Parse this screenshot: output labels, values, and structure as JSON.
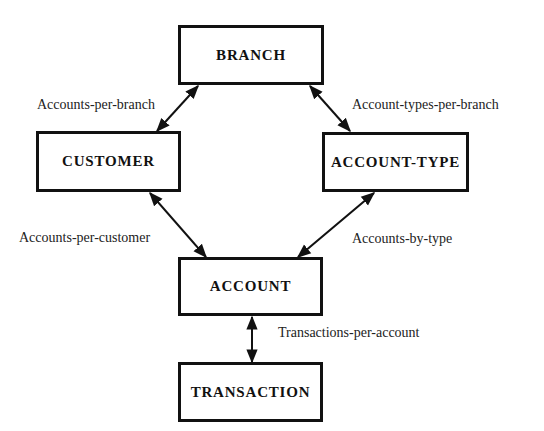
{
  "entities": {
    "branch": "BRANCH",
    "customer": "CUSTOMER",
    "account_type": "ACCOUNT-TYPE",
    "account": "ACCOUNT",
    "transaction": "TRANSACTION"
  },
  "relationships": {
    "accounts_per_branch": "Accounts-per-branch",
    "account_types_per_branch": "Account-types-per-branch",
    "accounts_per_customer": "Accounts-per-customer",
    "accounts_by_type": "Accounts-by-type",
    "transactions_per_account": "Transactions-per-account"
  },
  "links": [
    {
      "from": "branch",
      "to": "customer",
      "label": "accounts_per_branch"
    },
    {
      "from": "branch",
      "to": "account_type",
      "label": "account_types_per_branch"
    },
    {
      "from": "customer",
      "to": "account",
      "label": "accounts_per_customer"
    },
    {
      "from": "account_type",
      "to": "account",
      "label": "accounts_by_type"
    },
    {
      "from": "account",
      "to": "transaction",
      "label": "transactions_per_account"
    }
  ]
}
